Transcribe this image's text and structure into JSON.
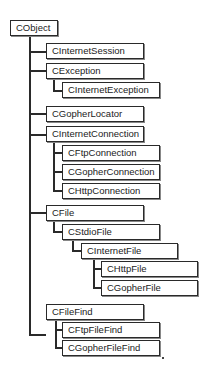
{
  "diagram": {
    "nodes": [
      {
        "id": "cobject",
        "label": "CObject",
        "parent": null
      },
      {
        "id": "cinternetsession",
        "label": "CInternetSession",
        "parent": "cobject"
      },
      {
        "id": "cexception",
        "label": "CException",
        "parent": "cobject"
      },
      {
        "id": "cinternetexception",
        "label": "CInternetException",
        "parent": "cexception"
      },
      {
        "id": "cgopherlocator",
        "label": "CGopherLocator",
        "parent": "cobject"
      },
      {
        "id": "cinternetconnection",
        "label": "CInternetConnection",
        "parent": "cobject"
      },
      {
        "id": "cftpconnection",
        "label": "CFtpConnection",
        "parent": "cinternetconnection"
      },
      {
        "id": "cgopherconnection",
        "label": "CGopherConnection",
        "parent": "cinternetconnection"
      },
      {
        "id": "chttpconnection",
        "label": "CHttpConnection",
        "parent": "cinternetconnection"
      },
      {
        "id": "cfile",
        "label": "CFile",
        "parent": "cobject"
      },
      {
        "id": "cstdiofile",
        "label": "CStdioFile",
        "parent": "cfile"
      },
      {
        "id": "cinternetfile",
        "label": "CInternetFile",
        "parent": "cstdiofile"
      },
      {
        "id": "chttpfile",
        "label": "CHttpFile",
        "parent": "cinternetfile"
      },
      {
        "id": "cgopherfile",
        "label": "CGopherFile",
        "parent": "cinternetfile"
      },
      {
        "id": "cfilefind",
        "label": "CFileFind",
        "parent": "cobject"
      },
      {
        "id": "cftpfilefind",
        "label": "CFtpFileFind",
        "parent": "cfilefind"
      },
      {
        "id": "cgopherfilefind",
        "label": "CGopherFileFind",
        "parent": "cfilefind"
      }
    ]
  }
}
